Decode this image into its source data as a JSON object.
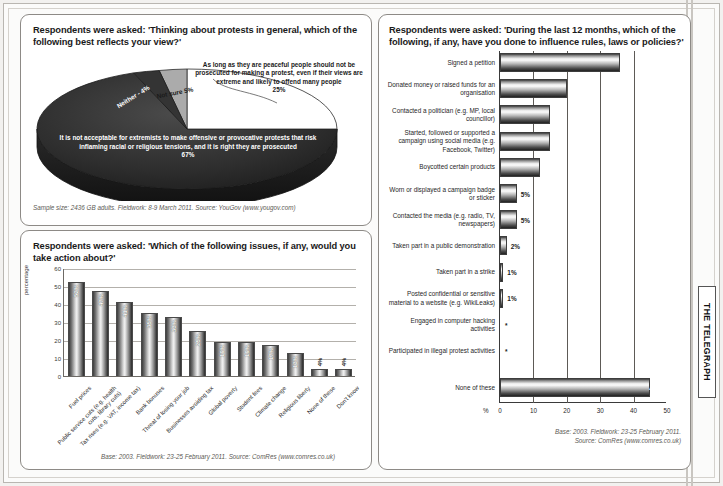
{
  "publication": {
    "masthead": "THE TELEGRAPH"
  },
  "panel_pie": {
    "question": "Respondents were asked: 'Thinking about protests in general, which of the following best reflects your view?'",
    "source": "Sample size: 2436 GB adults. Fieldwork: 8-9 March 2011. Source: YouGov (www.yougov.com)",
    "callout_25": "As long as they are peaceful people should not be prosecuted for making a protest, even if their views are extreme and likely to offend many people\n25%",
    "label_67": "It is not acceptable for extremists to make offensive or provocative protests that risk inflaming racial or religious tensions, and it is right they are prosecuted\n67%",
    "label_not_sure": "Not sure 5%",
    "label_neither": "Neither - 4%"
  },
  "panel_columns": {
    "question": "Respondents were asked: 'Which of the following issues, if any, would you take action about?'",
    "source": "Base: 2003. Fieldwork: 23-25 February 2011. Source: ComRes (www.comres.co.uk)"
  },
  "panel_hbar": {
    "question": "Respondents were asked: 'During the last 12 months, which of the following, if any, have you done to influence rules, laws or policies?'",
    "source": "Base: 2003. Fieldwork: 23-25 February 2011.\nSource: ComRes (www.comres.co.uk)",
    "axis_unit": "%"
  },
  "chart_data": [
    {
      "id": "protest-views-pie",
      "type": "pie",
      "title": "Thinking about protests in general, which of the following best reflects your view?",
      "legend": "inline-labels",
      "slices": [
        {
          "label": "It is not acceptable for extremists to make offensive or provocative protests that risk inflaming racial or religious tensions, and it is right they are prosecuted",
          "value": 67,
          "display": "67%",
          "color": "#2c2c2c"
        },
        {
          "label": "As long as they are peaceful people should not be prosecuted for making a protest, even if their views are extreme and likely to offend many people",
          "value": 25,
          "display": "25%",
          "color": "#ffffff"
        },
        {
          "label": "Not sure",
          "value": 5,
          "display": "5%",
          "color": "#a9a9a9"
        },
        {
          "label": "Neither",
          "value": 4,
          "display": "4%",
          "color": "#3a3a3a"
        }
      ],
      "source": "Sample size: 2436 GB adults. Fieldwork: 8-9 March 2011. Source: YouGov (www.yougov.com)"
    },
    {
      "id": "issues-take-action-bar",
      "type": "bar",
      "orientation": "vertical",
      "title": "Which of the following issues, if any, would you take action about?",
      "xlabel": "",
      "ylabel": "percentage",
      "ylim": [
        0,
        60
      ],
      "yticks": [
        0,
        10,
        20,
        30,
        40,
        50,
        60
      ],
      "grid": true,
      "categories": [
        "Fuel prices",
        "Public service cuts (e.g. health cuts, library cuts)",
        "Tax rises (e.g. VAT, income tax)",
        "Bank bonuses",
        "Threat of losing your job",
        "Businesses avoiding tax",
        "Global poverty",
        "Student fees",
        "Climate change",
        "Religious liberty",
        "None of these",
        "Don't know"
      ],
      "values": [
        52,
        47,
        41,
        35,
        33,
        25,
        19,
        19,
        17,
        13,
        4,
        4
      ],
      "value_labels": [
        "52%",
        "47%",
        "41%",
        "35%",
        "33%",
        "25%",
        "19%",
        "19%",
        "17%",
        "13%",
        "4%",
        "4%"
      ],
      "source": "Base: 2003. Fieldwork: 23-25 February 2011. Source: ComRes (www.comres.co.uk)"
    },
    {
      "id": "influence-actions-bar",
      "type": "bar",
      "orientation": "horizontal",
      "title": "During the last 12 months, which of the following, if any, have you done to influence rules, laws or policies?",
      "xlabel": "%",
      "ylabel": "",
      "xlim": [
        0,
        50
      ],
      "xticks": [
        0,
        10,
        20,
        30,
        40,
        50
      ],
      "grid": true,
      "categories": [
        "Signed a petition",
        "Donated money or raised funds for an organisation",
        "Contacted a politician (e.g. MP, local councillor)",
        "Started, followed or supported a campaign using social media (e.g. Facebook, Twitter)",
        "Boycotted certain products",
        "Worn or displayed a campaign badge or sticker",
        "Contacted the media (e.g. radio, TV, newspapers)",
        "Taken part in a public demonstration",
        "Taken part in a strike",
        "Posted confidential or sensitive material to a website (e.g. WikiLeaks)",
        "Engaged in computer hacking activities",
        "Participated in illegal protest activities",
        "None of these"
      ],
      "values": [
        36,
        20,
        15,
        15,
        12,
        5,
        5,
        2,
        1,
        1,
        0,
        0,
        45
      ],
      "value_labels": [
        "36%",
        "20%",
        "15%",
        "15%",
        "12%",
        "5%",
        "5%",
        "2%",
        "1%",
        "1%",
        "*",
        "*",
        "45%"
      ],
      "footnote_marker": "*",
      "source": "Base: 2003. Fieldwork: 23-25 February 2011. Source: ComRes (www.comres.co.uk)"
    }
  ]
}
